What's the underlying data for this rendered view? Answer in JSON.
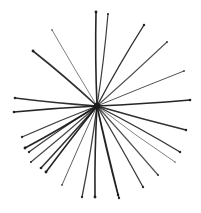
{
  "image": {
    "description": "Hand-drawn ink starburst: many thin dark lines radiating from a central point",
    "width": 201,
    "height": 213,
    "background": "#ffffff",
    "ink_color": "#1a1a1a",
    "center": [
      97,
      106
    ],
    "rays": [
      {
        "end": [
          96,
          12
        ],
        "w": 1.6,
        "o": 0.95
      },
      {
        "end": [
          52,
          30
        ],
        "w": 1.0,
        "o": 0.55
      },
      {
        "end": [
          33,
          51
        ],
        "w": 1.6,
        "o": 0.9
      },
      {
        "end": [
          15,
          98
        ],
        "w": 1.5,
        "o": 0.9
      },
      {
        "end": [
          14,
          112
        ],
        "w": 1.5,
        "o": 0.95
      },
      {
        "end": [
          108,
          14
        ],
        "w": 1.2,
        "o": 0.85
      },
      {
        "end": [
          144,
          25
        ],
        "w": 1.4,
        "o": 0.9
      },
      {
        "end": [
          167,
          42
        ],
        "w": 1.1,
        "o": 0.75
      },
      {
        "end": [
          184,
          71
        ],
        "w": 1.0,
        "o": 0.75
      },
      {
        "end": [
          190,
          100
        ],
        "w": 1.5,
        "o": 0.95
      },
      {
        "end": [
          22,
          137
        ],
        "w": 1.3,
        "o": 0.85
      },
      {
        "end": [
          25,
          148
        ],
        "w": 1.6,
        "o": 0.95
      },
      {
        "end": [
          29,
          152
        ],
        "w": 1.3,
        "o": 0.85
      },
      {
        "end": [
          31,
          162
        ],
        "w": 1.2,
        "o": 0.8
      },
      {
        "end": [
          41,
          168
        ],
        "w": 1.5,
        "o": 0.9
      },
      {
        "end": [
          46,
          172
        ],
        "w": 1.6,
        "o": 0.95
      },
      {
        "end": [
          62,
          185
        ],
        "w": 1.0,
        "o": 0.7
      },
      {
        "end": [
          82,
          197
        ],
        "w": 1.3,
        "o": 0.85
      },
      {
        "end": [
          95,
          197
        ],
        "w": 1.6,
        "o": 0.95
      },
      {
        "end": [
          186,
          130
        ],
        "w": 1.4,
        "o": 0.9
      },
      {
        "end": [
          180,
          152
        ],
        "w": 1.4,
        "o": 0.9
      },
      {
        "end": [
          175,
          162
        ],
        "w": 0.9,
        "o": 0.6
      },
      {
        "end": [
          158,
          175
        ],
        "w": 1.2,
        "o": 0.75
      },
      {
        "end": [
          143,
          187
        ],
        "w": 1.3,
        "o": 0.85
      },
      {
        "end": [
          118,
          195
        ],
        "w": 1.4,
        "o": 0.9
      },
      {
        "end": [
          119,
          198
        ],
        "w": 1.3,
        "o": 0.85
      }
    ]
  }
}
